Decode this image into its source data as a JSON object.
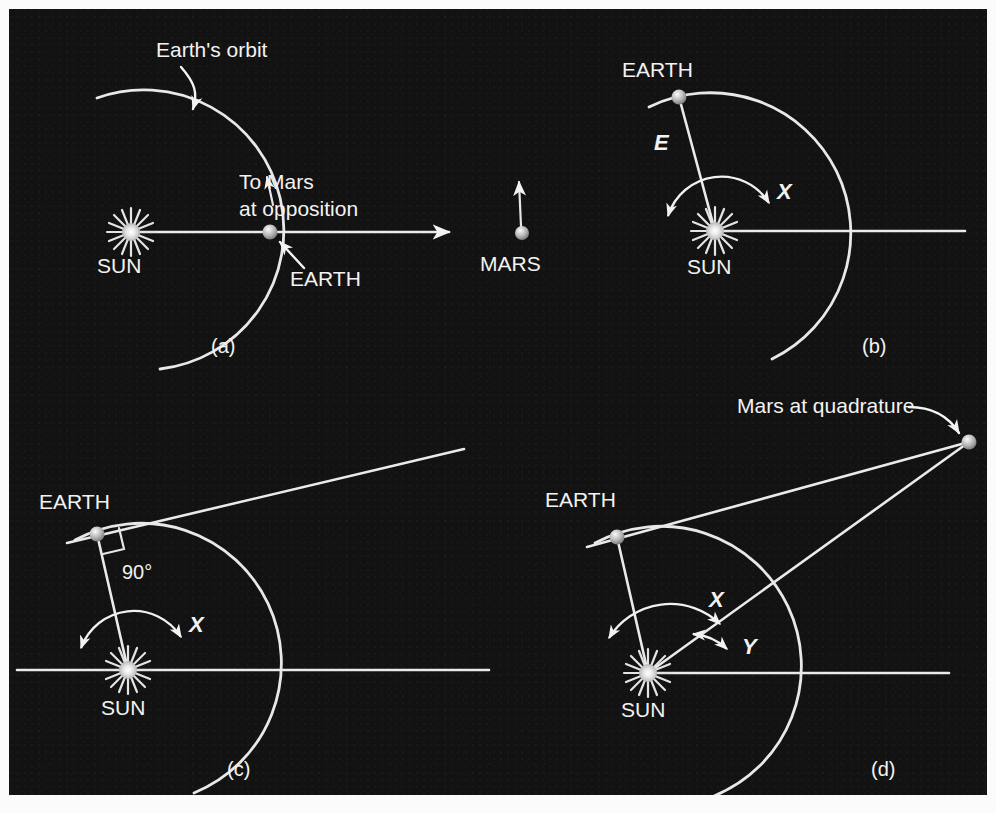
{
  "figure": {
    "background_color": "#121212",
    "ink_color": "#eaeaea",
    "page_color": "#ffffff"
  },
  "panels": [
    {
      "id": "a",
      "panel_label": "(a)",
      "labels": {
        "orbit": "Earth's orbit",
        "sun": "SUN",
        "earth": "EARTH",
        "mars": "MARS",
        "direction": "To Mars\nat opposition",
        "direction_line1": "To Mars",
        "direction_line2": "at opposition"
      },
      "bodies": {
        "sun": {
          "cx": 131,
          "cy": 232,
          "r": 9
        },
        "earth": {
          "cx": 270,
          "cy": 232,
          "r": 7
        },
        "mars": {
          "cx": 522,
          "cy": 233,
          "r": 7
        }
      },
      "orbit": {
        "cx": 131,
        "cy": 232,
        "r": 140
      }
    },
    {
      "id": "b",
      "panel_label": "(b)",
      "labels": {
        "sun": "SUN",
        "earth": "EARTH",
        "radius": "E",
        "angle": "X"
      },
      "bodies": {
        "sun": {
          "cx": 715,
          "cy": 231,
          "r": 9
        },
        "earth": {
          "cx": 679,
          "cy": 97,
          "r": 7
        }
      },
      "orbit": {
        "cx": 715,
        "cy": 231,
        "r": 140
      }
    },
    {
      "id": "c",
      "panel_label": "(c)",
      "labels": {
        "sun": "SUN",
        "earth": "EARTH",
        "right_angle": "90°",
        "angle": "X"
      },
      "bodies": {
        "sun": {
          "cx": 128,
          "cy": 670,
          "r": 9
        },
        "earth": {
          "cx": 97,
          "cy": 534,
          "r": 7
        }
      },
      "orbit": {
        "cx": 128,
        "cy": 670,
        "r": 140
      }
    },
    {
      "id": "d",
      "panel_label": "(d)",
      "labels": {
        "sun": "SUN",
        "earth": "EARTH",
        "mars": "Mars at quadrature",
        "angle_x": "X",
        "angle_y": "Y"
      },
      "bodies": {
        "sun": {
          "cx": 648,
          "cy": 673,
          "r": 9
        },
        "earth": {
          "cx": 617,
          "cy": 537,
          "r": 7
        },
        "mars": {
          "cx": 969,
          "cy": 442,
          "r": 7
        }
      },
      "orbit": {
        "cx": 648,
        "cy": 673,
        "r": 140
      }
    }
  ]
}
